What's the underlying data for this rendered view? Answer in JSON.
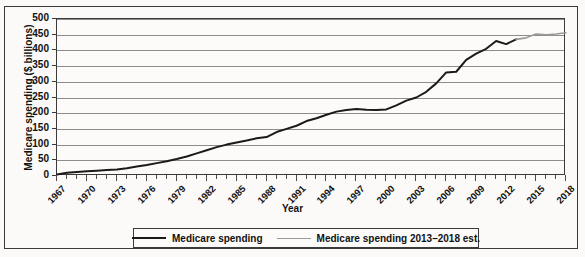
{
  "figure": {
    "x_axis_title": "Year",
    "y_axis_title": "Medicare spending ($ billions)"
  },
  "legend": {
    "entries": [
      {
        "label": "Medicare spending",
        "color": "#1a1a1a",
        "style": "actual"
      },
      {
        "label": "Medicare spending 2013–2018 est.",
        "color": "#9a9a9a",
        "style": "est"
      }
    ]
  },
  "chart_data": {
    "type": "line",
    "title": "",
    "xlabel": "Year",
    "ylabel": "Medicare spending ($ billions)",
    "xlim": [
      1967,
      2018
    ],
    "ylim": [
      0,
      500
    ],
    "ytick_labels": [
      "0",
      "50",
      "100",
      "150",
      "200",
      "250",
      "300",
      "350",
      "400",
      "450",
      "500"
    ],
    "yticks": [
      0,
      50,
      100,
      150,
      200,
      250,
      300,
      350,
      400,
      450,
      500
    ],
    "xtick_labels": [
      "1967",
      "1970",
      "1973",
      "1976",
      "1979",
      "1982",
      "1985",
      "1988",
      "1991",
      "1994",
      "1997",
      "2000",
      "2003",
      "2006",
      "2009",
      "2012",
      "2015",
      "2018"
    ],
    "xticks": [
      1967,
      1970,
      1973,
      1976,
      1979,
      1982,
      1985,
      1988,
      1991,
      1994,
      1997,
      2000,
      2003,
      2006,
      2009,
      2012,
      2015,
      2018
    ],
    "minor_xticks_every": 1,
    "grid": "horizontal",
    "legend_position": "below-axes-center",
    "x": [
      1967,
      1968,
      1969,
      1970,
      1971,
      1972,
      1973,
      1974,
      1975,
      1976,
      1977,
      1978,
      1979,
      1980,
      1981,
      1982,
      1983,
      1984,
      1985,
      1986,
      1987,
      1988,
      1989,
      1990,
      1991,
      1992,
      1993,
      1994,
      1995,
      1996,
      1997,
      1998,
      1999,
      2000,
      2001,
      2002,
      2003,
      2004,
      2005,
      2006,
      2007,
      2008,
      2009,
      2010,
      2011,
      2012,
      2013,
      2014,
      2015,
      2016,
      2017,
      2018
    ],
    "series": [
      {
        "name": "Medicare spending",
        "color": "#1a1a1a",
        "x": [
          1967,
          1968,
          1969,
          1970,
          1971,
          1972,
          1973,
          1974,
          1975,
          1976,
          1977,
          1978,
          1979,
          1980,
          1981,
          1982,
          1983,
          1984,
          1985,
          1986,
          1987,
          1988,
          1989,
          1990,
          1991,
          1992,
          1993,
          1994,
          1995,
          1996,
          1997,
          1998,
          1999,
          2000,
          2001,
          2002,
          2003,
          2004,
          2005,
          2006,
          2007,
          2008,
          2009,
          2010,
          2011,
          2012,
          2013
        ],
        "values": [
          5,
          10,
          13,
          15,
          17,
          19,
          21,
          25,
          30,
          35,
          41,
          47,
          54,
          62,
          72,
          82,
          92,
          100,
          107,
          113,
          120,
          124,
          140,
          150,
          160,
          175,
          184,
          195,
          205,
          210,
          213,
          211,
          210,
          212,
          225,
          240,
          250,
          268,
          295,
          330,
          332,
          370,
          390,
          405,
          430,
          420,
          435
        ]
      },
      {
        "name": "Medicare spending 2013–2018 est.",
        "color": "#9a9a9a",
        "x": [
          2013,
          2014,
          2015,
          2016,
          2017,
          2018
        ],
        "values": [
          435,
          440,
          452,
          450,
          452,
          456
        ]
      }
    ]
  }
}
